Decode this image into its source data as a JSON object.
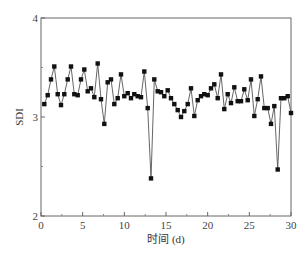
{
  "chart_data": {
    "type": "line",
    "title": "",
    "xlabel": "时间 (d)",
    "ylabel": "SDI",
    "xlim": [
      0,
      30
    ],
    "ylim": [
      2,
      4
    ],
    "xticks": [
      0,
      5,
      10,
      15,
      20,
      25,
      30
    ],
    "yticks": [
      2,
      3,
      4
    ],
    "grid": false,
    "legend": null,
    "marker": "square",
    "line_color": "#555555",
    "marker_color": "#111111",
    "series": [
      {
        "name": "SDI",
        "x": [
          0.4,
          0.8,
          1.2,
          1.6,
          2.0,
          2.4,
          2.8,
          3.2,
          3.6,
          4.0,
          4.4,
          4.8,
          5.2,
          5.6,
          6.0,
          6.4,
          6.8,
          7.2,
          7.6,
          8.0,
          8.4,
          8.8,
          9.2,
          9.6,
          10.0,
          10.4,
          10.8,
          11.2,
          11.6,
          12.0,
          12.4,
          12.8,
          13.2,
          13.6,
          14.0,
          14.4,
          14.8,
          15.2,
          15.6,
          16.0,
          16.4,
          16.8,
          17.2,
          17.6,
          18.0,
          18.4,
          18.8,
          19.2,
          19.6,
          20.0,
          20.4,
          20.8,
          21.2,
          21.6,
          22.0,
          22.4,
          22.8,
          23.2,
          23.6,
          24.0,
          24.4,
          24.8,
          25.2,
          25.6,
          26.0,
          26.4,
          26.8,
          27.2,
          27.6,
          28.0,
          28.4,
          28.8,
          29.2,
          29.6,
          30.0
        ],
        "values": [
          3.13,
          3.22,
          3.38,
          3.51,
          3.23,
          3.12,
          3.23,
          3.38,
          3.51,
          3.23,
          3.22,
          3.38,
          3.48,
          3.26,
          3.29,
          3.2,
          3.54,
          3.18,
          2.93,
          3.35,
          3.38,
          3.13,
          3.19,
          3.43,
          3.21,
          3.24,
          3.19,
          3.23,
          3.21,
          3.2,
          3.46,
          3.09,
          2.38,
          3.38,
          3.26,
          3.25,
          3.21,
          3.27,
          3.19,
          3.13,
          3.07,
          3.0,
          3.06,
          3.13,
          3.29,
          3.01,
          3.17,
          3.21,
          3.23,
          3.22,
          3.29,
          3.33,
          3.19,
          3.43,
          3.08,
          3.23,
          3.14,
          3.3,
          3.16,
          3.16,
          3.28,
          3.17,
          3.38,
          3.01,
          3.18,
          3.41,
          3.09,
          3.09,
          2.93,
          3.11,
          2.47,
          3.19,
          3.19,
          3.21,
          3.04
        ]
      }
    ]
  }
}
